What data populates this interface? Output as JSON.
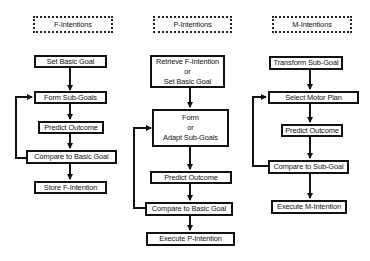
{
  "columns": [
    {
      "id": "f",
      "header": "F-Intentions",
      "steps": [
        {
          "lines": [
            "Set Basic Goal"
          ]
        },
        {
          "lines": [
            "Form Sub-Goals"
          ]
        },
        {
          "lines": [
            "Predict Outcome"
          ]
        },
        {
          "lines": [
            "Compare to Basic Goal"
          ]
        },
        {
          "lines": [
            "Store F-Intention"
          ]
        }
      ],
      "feedback": {
        "from": "Compare to Basic Goal",
        "to": "Form Sub-Goals"
      }
    },
    {
      "id": "p",
      "header": "P-Intentions",
      "steps": [
        {
          "lines": [
            "Retrieve F-Intention",
            "or",
            "Set Basic Goal"
          ]
        },
        {
          "lines": [
            "Form",
            "or",
            "Adapt Sub-Goals"
          ]
        },
        {
          "lines": [
            "Predict Outcome"
          ]
        },
        {
          "lines": [
            "Compare to Basic Goal"
          ]
        },
        {
          "lines": [
            "Execute P-Intention"
          ]
        }
      ],
      "feedback": {
        "from": "Compare to Basic Goal",
        "to": "Form or Adapt Sub-Goals"
      }
    },
    {
      "id": "m",
      "header": "M-Intentions",
      "steps": [
        {
          "lines": [
            "Transform Sub-Goal"
          ]
        },
        {
          "lines": [
            "Select Motor Plan"
          ]
        },
        {
          "lines": [
            "Predict Outcome"
          ]
        },
        {
          "lines": [
            "Compare to Sub-Goal"
          ]
        },
        {
          "lines": [
            "Execute M-Intention"
          ]
        }
      ],
      "feedback": {
        "from": "Compare to Sub-Goal",
        "to": "Select Motor Plan"
      }
    }
  ],
  "colors": {
    "stroke": "#111111",
    "background": "#ffffff"
  }
}
